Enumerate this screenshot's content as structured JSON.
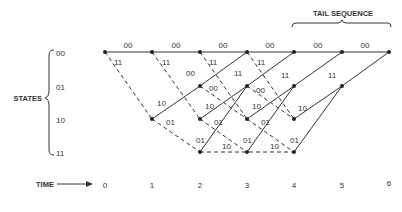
{
  "header": {
    "tail_label": "TAIL SEQUENCE"
  },
  "states": {
    "label": "STATES",
    "items": [
      "00",
      "01",
      "10",
      "11"
    ]
  },
  "time": {
    "label": "TIME",
    "ticks": [
      "0",
      "1",
      "2",
      "3",
      "4",
      "5",
      "6"
    ]
  },
  "trellis": {
    "solid_edges": [
      {
        "from": [
          0,
          "00"
        ],
        "to": [
          1,
          "00"
        ],
        "label": "00"
      },
      {
        "from": [
          1,
          "00"
        ],
        "to": [
          2,
          "00"
        ],
        "label": "00"
      },
      {
        "from": [
          2,
          "00"
        ],
        "to": [
          3,
          "00"
        ],
        "label": "00"
      },
      {
        "from": [
          3,
          "00"
        ],
        "to": [
          4,
          "00"
        ],
        "label": "00"
      },
      {
        "from": [
          4,
          "00"
        ],
        "to": [
          5,
          "00"
        ],
        "label": "00"
      },
      {
        "from": [
          5,
          "00"
        ],
        "to": [
          6,
          "00"
        ],
        "label": "00"
      },
      {
        "from": [
          1,
          "10"
        ],
        "to": [
          2,
          "01"
        ],
        "label": "10"
      },
      {
        "from": [
          2,
          "01"
        ],
        "to": [
          3,
          "00"
        ],
        "label": "11"
      },
      {
        "from": [
          2,
          "10"
        ],
        "to": [
          3,
          "01"
        ],
        "label": "10"
      },
      {
        "from": [
          2,
          "11"
        ],
        "to": [
          3,
          "01"
        ],
        "label": "01"
      },
      {
        "from": [
          3,
          "01"
        ],
        "to": [
          4,
          "00"
        ],
        "label": "11"
      },
      {
        "from": [
          3,
          "10"
        ],
        "to": [
          4,
          "01"
        ],
        "label": "10"
      },
      {
        "from": [
          3,
          "11"
        ],
        "to": [
          4,
          "01"
        ],
        "label": "01"
      },
      {
        "from": [
          4,
          "01"
        ],
        "to": [
          5,
          "00"
        ],
        "label": "11"
      },
      {
        "from": [
          4,
          "10"
        ],
        "to": [
          5,
          "01"
        ],
        "label": "10"
      },
      {
        "from": [
          4,
          "11"
        ],
        "to": [
          5,
          "01"
        ],
        "label": "01"
      },
      {
        "from": [
          5,
          "01"
        ],
        "to": [
          6,
          "00"
        ],
        "label": "11"
      }
    ],
    "dashed_edges": [
      {
        "from": [
          0,
          "00"
        ],
        "to": [
          1,
          "10"
        ],
        "label": "11"
      },
      {
        "from": [
          1,
          "00"
        ],
        "to": [
          2,
          "10"
        ],
        "label": "11"
      },
      {
        "from": [
          1,
          "10"
        ],
        "to": [
          2,
          "11"
        ],
        "label": "01"
      },
      {
        "from": [
          2,
          "00"
        ],
        "to": [
          3,
          "10"
        ],
        "label": "11"
      },
      {
        "from": [
          2,
          "01"
        ],
        "to": [
          3,
          "10"
        ],
        "label": "00"
      },
      {
        "from": [
          2,
          "11"
        ],
        "to": [
          3,
          "11"
        ],
        "label": "10"
      },
      {
        "from": [
          3,
          "00"
        ],
        "to": [
          4,
          "10"
        ],
        "label": "11"
      },
      {
        "from": [
          3,
          "01"
        ],
        "to": [
          4,
          "10"
        ],
        "label": "00"
      },
      {
        "from": [
          3,
          "10"
        ],
        "to": [
          4,
          "11"
        ],
        "label": "01"
      },
      {
        "from": [
          3,
          "11"
        ],
        "to": [
          4,
          "11"
        ],
        "label": "10"
      },
      {
        "from": [
          2,
          "10"
        ],
        "to": [
          3,
          "11"
        ],
        "label": "01"
      }
    ]
  }
}
